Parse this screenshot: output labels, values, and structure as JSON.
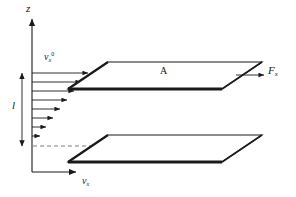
{
  "figure": {
    "background_color": "#ffffff",
    "line_color": "#1a1a1a",
    "dash_color": "#666666",
    "width": 296,
    "height": 197
  },
  "labels": {
    "z_axis": "z",
    "vx_axis": "v",
    "vx_axis_sub": "x",
    "velocity_top": "v",
    "velocity_top_sub": "x",
    "velocity_top_sup": "0",
    "gap": "l",
    "area": "A",
    "force": "F",
    "force_sub": "x"
  },
  "axes": {
    "vertical": {
      "x": 32,
      "y_top": 17,
      "y_bottom": 172,
      "arrow": "up",
      "label": "z"
    },
    "horizontal": {
      "y": 172,
      "x_left": 32,
      "x_right": 78,
      "arrow": "right",
      "label": "v_x"
    }
  },
  "gap_indicator": {
    "x": 22,
    "y_top": 73,
    "y_bottom": 146,
    "arrow": "double",
    "label": "l"
  },
  "velocity_profile": {
    "description": "Linear Couette velocity profile, arrows decreasing from top plate to bottom plate",
    "arrow_count": 8,
    "arrows": [
      {
        "y": 73,
        "length": 58
      },
      {
        "y": 82,
        "length": 51
      },
      {
        "y": 91,
        "length": 44
      },
      {
        "y": 100,
        "length": 37
      },
      {
        "y": 109,
        "length": 30
      },
      {
        "y": 118,
        "length": 23
      },
      {
        "y": 127,
        "length": 16
      },
      {
        "y": 136,
        "length": 9
      }
    ]
  },
  "plates": [
    {
      "name": "upper-plate",
      "label": "A",
      "front_left_x": 68,
      "front_right_x": 222,
      "front_y": 89,
      "back_left_x": 108,
      "back_right_x": 262,
      "back_y": 62,
      "thick_edge": "front"
    },
    {
      "name": "lower-plate",
      "label": "",
      "front_left_x": 68,
      "front_right_x": 222,
      "front_y": 162,
      "back_left_x": 108,
      "back_right_x": 262,
      "back_y": 135,
      "thick_edge": "front"
    }
  ],
  "dashed_lines": [
    {
      "name": "upper-guide",
      "x1": 70,
      "y1": 73,
      "x2": 108,
      "y2": 73
    },
    {
      "name": "lower-guide",
      "x1": 33,
      "y1": 146,
      "x2": 108,
      "y2": 146
    }
  ],
  "force_arrow": {
    "x1": 236,
    "y1": 75,
    "x2": 266,
    "y2": 75,
    "direction": "right",
    "label": "F_x"
  }
}
